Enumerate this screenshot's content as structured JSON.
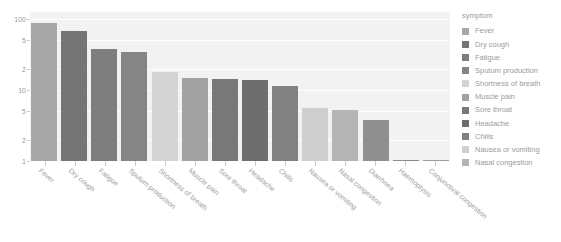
{
  "chart_data": {
    "type": "bar",
    "title": "",
    "xlabel": "",
    "ylabel": "",
    "yscale": "log",
    "ylim": [
      0.7,
      110
    ],
    "grid": true,
    "legend_position": "right",
    "legend_title": "symptom",
    "ytick_labels": [
      "100",
      "5",
      "2",
      "10",
      "5",
      "2",
      "1"
    ],
    "ytick_values": [
      100,
      50,
      20,
      10,
      5,
      2,
      1
    ],
    "categories": [
      "Fever",
      "Dry cough",
      "Fatigue",
      "Sputum production",
      "Shortness of breath",
      "Muscle pain",
      "Sore throat",
      "Headache",
      "Chills",
      "Nausea or vomiting",
      "Nasal congestion",
      "Diarrhoea",
      "Haemoptysis",
      "Conjunctival congestion"
    ],
    "values": [
      88,
      68,
      38,
      34,
      18,
      14.8,
      14.2,
      13.8,
      11.4,
      5.5,
      5.3,
      3.8,
      0.93,
      0.8
    ],
    "bar_colors": [
      "#a8a8a8",
      "#757575",
      "#7e7e7e",
      "#858585",
      "#d4d4d4",
      "#a2a2a2",
      "#787878",
      "#6e6e6e",
      "#818181",
      "#cfcfcf",
      "#b4b4b4",
      "#8f8f8f",
      "#8a8a8a",
      "#9c9c9c"
    ]
  },
  "legend": {
    "title": "symptom",
    "items": [
      {
        "label": "Fever",
        "color": "#a8a8a8"
      },
      {
        "label": "Dry cough",
        "color": "#757575"
      },
      {
        "label": "Fatigue",
        "color": "#7e7e7e"
      },
      {
        "label": "Sputum production",
        "color": "#858585"
      },
      {
        "label": "Shortness of breath",
        "color": "#d4d4d4"
      },
      {
        "label": "Muscle pain",
        "color": "#a2a2a2"
      },
      {
        "label": "Sore throat",
        "color": "#787878"
      },
      {
        "label": "Headache",
        "color": "#6e6e6e"
      },
      {
        "label": "Chills",
        "color": "#818181"
      },
      {
        "label": "Nausea or vomiting",
        "color": "#cfcfcf"
      },
      {
        "label": "Nasal congestion",
        "color": "#b4b4b4"
      }
    ]
  }
}
